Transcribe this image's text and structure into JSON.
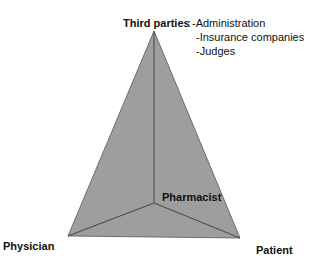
{
  "diagram": {
    "type": "pyramid",
    "fill_color": "#9e9e9e",
    "edge_color": "#3a3a3a",
    "vertices": {
      "top": {
        "label": "Third parties"
      },
      "bottom_left": {
        "label": "Physician"
      },
      "bottom_right": {
        "label": "Patient"
      },
      "center": {
        "label": "Pharmacist"
      }
    },
    "third_parties_list": {
      "separator": ":",
      "items": [
        "-Administration",
        "-Insurance companies",
        "-Judges"
      ]
    }
  }
}
